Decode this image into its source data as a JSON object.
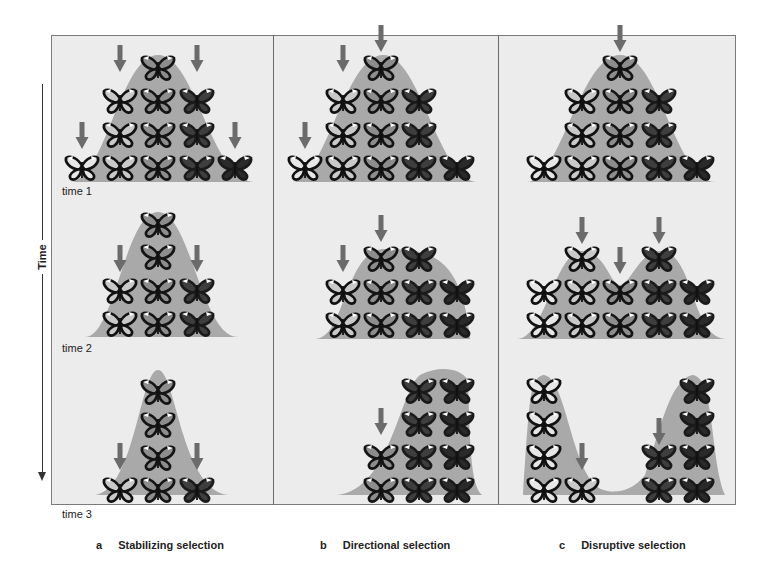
{
  "axis": {
    "label": "Time",
    "direction": "down"
  },
  "time_labels": [
    "time 1",
    "time 2",
    "time 3"
  ],
  "panels": [
    {
      "letter": "a",
      "title": "Stabilizing selection"
    },
    {
      "letter": "b",
      "title": "Directional selection"
    },
    {
      "letter": "c",
      "title": "Disruptive selection"
    }
  ],
  "colors": {
    "background": "#ececec",
    "curve": "#a9a9a9",
    "arrow": "#6b6b6b",
    "frame": "#7a7a7a",
    "butterfly_light": "#d8d8d8",
    "butterfly_mid": "#8a8a8a",
    "butterfly_dark": "#3a3a3a"
  },
  "legend": {
    "phenotype_shades": [
      "light",
      "light-mid",
      "mid",
      "dark",
      "darkest"
    ],
    "arrow_meaning": "selection against phenotype"
  }
}
